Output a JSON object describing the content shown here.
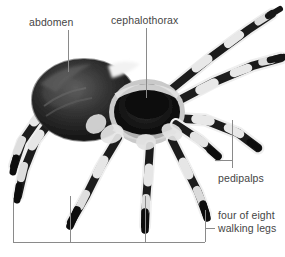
{
  "figure": {
    "background_color": "#ffffff",
    "label_color": "#454545",
    "leader_line_color": "#8a8a8a",
    "width": 285,
    "height": 257
  },
  "labels": {
    "abdomen": "abdomen",
    "cephalothorax": "cephalothorax",
    "pedipalps": "pedipalps",
    "walking_legs_line1": "four of eight",
    "walking_legs_line2": "walking legs"
  },
  "annotations": [
    {
      "name": "abdomen",
      "text": "abdomen",
      "type": "leader-line",
      "line": {
        "x1": 68,
        "y1": 30,
        "x2": 68,
        "y2": 72
      }
    },
    {
      "name": "cephalothorax",
      "text": "cephalothorax",
      "type": "leader-line",
      "line": {
        "x1": 146,
        "y1": 28,
        "x2": 146,
        "y2": 98
      }
    },
    {
      "name": "pedipalps",
      "text": "pedipalps",
      "type": "bracket-vertical",
      "line": {
        "x1": 232,
        "y1": 120,
        "x2": 232,
        "y2": 168
      },
      "tick": {
        "x1": 215,
        "y1": 160,
        "x2": 232,
        "y2": 160
      }
    },
    {
      "name": "walking-legs",
      "text": "four of eight walking legs",
      "type": "bracket-bottom",
      "baseline": {
        "x1": 13,
        "y1": 242,
        "x2": 205,
        "y2": 242
      },
      "ticks": [
        {
          "x": 13,
          "y1": 198,
          "y2": 242
        },
        {
          "x": 70,
          "y1": 196,
          "y2": 242
        },
        {
          "x": 145,
          "y1": 196,
          "y2": 242
        },
        {
          "x": 205,
          "y1": 210,
          "y2": 242
        }
      ],
      "connector": {
        "x1": 205,
        "y1": 228,
        "x2": 215,
        "y2": 228
      }
    }
  ]
}
